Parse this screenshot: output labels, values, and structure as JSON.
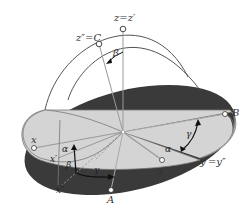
{
  "figure": {
    "colors": {
      "dark_plane": "#3a3a3a",
      "light_plane": "#d4d4d4",
      "arc_lines": "#555555",
      "axis_lines": "#888888",
      "point_fill": "#ffffff",
      "arrow": "#111111",
      "background": "#ffffff"
    },
    "labels": {
      "z_axis": "z=z′",
      "z_double_prime": "z″=C",
      "beta_top": "β",
      "B": "B",
      "x": "x",
      "x_prime": "x′",
      "x_double_prime": "x″",
      "alpha_left": "α",
      "beta_bottom": "β",
      "gamma_bottom": "γ",
      "gamma_right": "γ",
      "alpha_right": "α",
      "y": "y",
      "y_prime_eq": "y′=y″",
      "A": "A"
    },
    "points": [
      {
        "name": "z",
        "x": 123,
        "y": 29
      },
      {
        "name": "C",
        "x": 99,
        "y": 44
      },
      {
        "name": "B",
        "x": 225,
        "y": 114
      },
      {
        "name": "x",
        "x": 34,
        "y": 148
      },
      {
        "name": "y",
        "x": 162,
        "y": 160
      },
      {
        "name": "A",
        "x": 111,
        "y": 190
      },
      {
        "name": "origin",
        "x": 123,
        "y": 132
      }
    ]
  }
}
